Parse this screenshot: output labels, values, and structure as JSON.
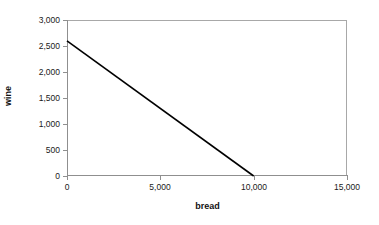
{
  "chart_data": {
    "type": "line",
    "title": "",
    "subtitle": "",
    "xlabel": "bread",
    "ylabel": "wine",
    "xlim": [
      0,
      15000
    ],
    "ylim": [
      0,
      3000
    ],
    "grid": false,
    "legend": false,
    "legend_position": "none",
    "x_ticks": [
      0,
      5000,
      10000,
      15000
    ],
    "x_tick_labels": [
      "0",
      "5,000",
      "10,000",
      "15,000"
    ],
    "y_ticks": [
      0,
      500,
      1000,
      1500,
      2000,
      2500,
      3000
    ],
    "y_tick_labels": [
      "0",
      "500",
      "1,000",
      "1,500",
      "2,000",
      "2,500",
      "3,000"
    ],
    "series": [
      {
        "name": "budget-constraint",
        "color": "#000000",
        "x": [
          0,
          10000
        ],
        "values": [
          2600,
          0
        ]
      }
    ],
    "annotations": []
  },
  "colors": {
    "series_line": "#000000",
    "axis": "#8f8f8f",
    "frame": "#a8a8a8",
    "text": "#1a1a1a",
    "background": "#ffffff"
  }
}
